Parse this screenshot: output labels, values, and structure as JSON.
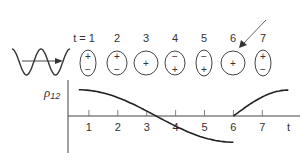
{
  "diagram": {
    "wave": {
      "icon": "sine-wave-with-arrow-icon",
      "cycles": 2
    },
    "time_steps": [
      {
        "label": "t = 1",
        "shape": "ellipse-tall",
        "top_sign": "+",
        "bottom_sign": "−"
      },
      {
        "label": "2",
        "shape": "ellipse",
        "top_sign": "+",
        "bottom_sign": "−"
      },
      {
        "label": "3",
        "shape": "circle",
        "top_sign": "",
        "center_sign": "+",
        "bottom_sign": ""
      },
      {
        "label": "4",
        "shape": "ellipse",
        "top_sign": "−",
        "bottom_sign": "+"
      },
      {
        "label": "5",
        "shape": "ellipse-tall",
        "top_sign": "−",
        "bottom_sign": "+"
      },
      {
        "label": "6",
        "shape": "circle",
        "top_sign": "",
        "center_sign": "+",
        "bottom_sign": "",
        "highlighted_by_arrow": true
      },
      {
        "label": "7",
        "shape": "ellipse-tall",
        "top_sign": "+",
        "bottom_sign": "−"
      }
    ],
    "graph": {
      "y_label": "ρ",
      "y_label_subscript": "12",
      "x_label": "t",
      "x_ticks": [
        "1",
        "2",
        "3",
        "4",
        "5",
        "6",
        "7"
      ]
    },
    "colors": {
      "ink": "#333333",
      "background": "#ffffff"
    }
  },
  "chart_data": {
    "type": "line",
    "title": "",
    "xlabel": "t",
    "ylabel": "ρ12",
    "x_ticks": [
      1,
      2,
      3,
      4,
      5,
      6,
      7
    ],
    "xlim": [
      0,
      8
    ],
    "ylim": [
      -1.1,
      1.1
    ],
    "grid": false,
    "series": [
      {
        "name": "segment-1",
        "x": [
          0.5,
          1,
          1.5,
          2,
          2.5,
          3,
          3.5,
          4,
          4.5,
          5,
          5.5,
          6
        ],
        "y": [
          1.0,
          0.97,
          0.87,
          0.71,
          0.5,
          0.0,
          -0.3,
          -0.55,
          -0.75,
          -0.89,
          -0.97,
          -1.0
        ]
      },
      {
        "name": "segment-2",
        "x": [
          6,
          6.5,
          7,
          7.5,
          7.9
        ],
        "y": [
          0.0,
          0.45,
          0.75,
          0.92,
          0.96
        ]
      }
    ]
  }
}
